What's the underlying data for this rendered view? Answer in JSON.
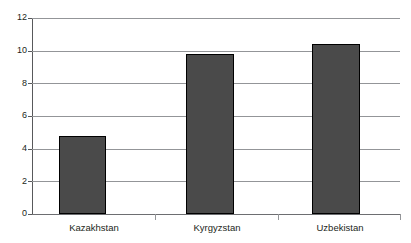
{
  "chart_data": {
    "type": "bar",
    "title": "",
    "xlabel": "",
    "ylabel": "",
    "categories": [
      "Kazakhstan",
      "Kyrgyzstan",
      "Uzbekistan"
    ],
    "values": [
      4.8,
      9.8,
      10.4
    ],
    "ylim": [
      0,
      12
    ],
    "yticks": [
      0,
      2,
      4,
      6,
      8,
      10,
      12
    ],
    "ytick_labels": [
      "0",
      "2",
      "4",
      "6",
      "8",
      "10",
      "12"
    ],
    "grid": true,
    "legend": false,
    "series": [
      {
        "name": "",
        "values": [
          4.8,
          9.8,
          10.4
        ]
      }
    ],
    "bar_color": "#4a4a4a",
    "bar_border_color": "#000000",
    "gridline_color": "#939598",
    "axis_color": "#58595b",
    "background": "#ffffff"
  }
}
